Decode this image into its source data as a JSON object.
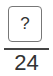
{
  "fraction": {
    "numerator": "?",
    "denominator": "24"
  }
}
